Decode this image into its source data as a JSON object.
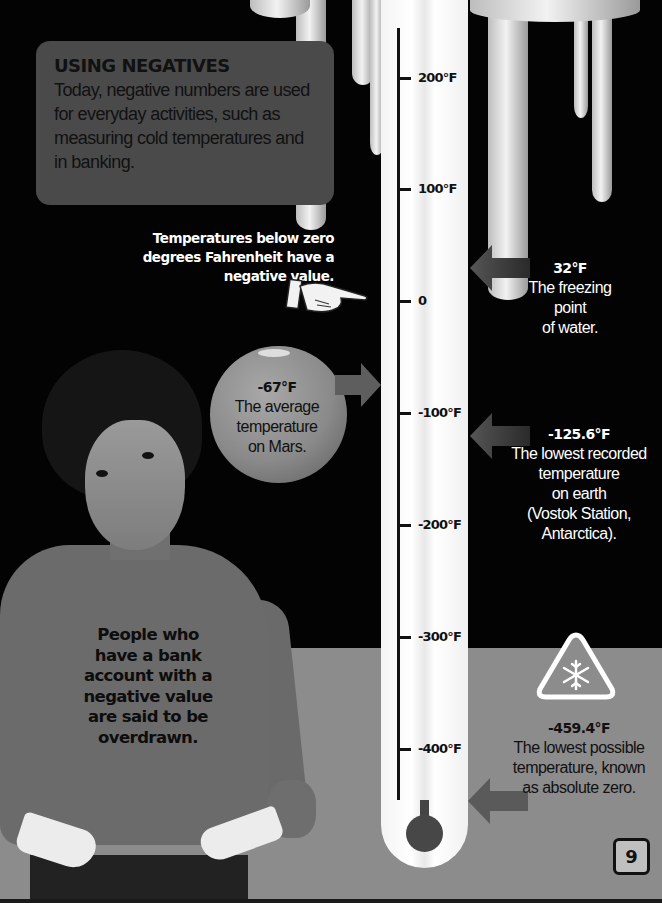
{
  "info_box": {
    "title": "USING NEGATIVES",
    "body": "Today, negative numbers are used for everyday activities, such as measuring cold temperatures and in banking."
  },
  "note": "Temperatures below zero degrees Fahrenheit have a negative value.",
  "thermometer": {
    "unit": "°F",
    "ticks": [
      {
        "label": "200°F",
        "value": 200
      },
      {
        "label": "100°F",
        "value": 100
      },
      {
        "label": "0",
        "value": 0
      },
      {
        "label": "-100°F",
        "value": -100
      },
      {
        "label": "-200°F",
        "value": -200
      },
      {
        "label": "-300°F",
        "value": -300
      },
      {
        "label": "-400°F",
        "value": -400
      }
    ]
  },
  "callouts": {
    "freezing": {
      "value": "32°F",
      "l1": "The freezing",
      "l2": "point",
      "l3": "of water."
    },
    "mars": {
      "value": "-67°F",
      "l1": "The average",
      "l2": "temperature",
      "l3": "on Mars."
    },
    "vostok": {
      "value": "-125.6°F",
      "l1": "The lowest recorded",
      "l2": "temperature",
      "l3": "on earth",
      "l4": "(Vostok Station,",
      "l5": "Antarctica)."
    },
    "absolute_zero": {
      "value": "-459.4°F",
      "l1": "The lowest possible",
      "l2": "temperature, known",
      "l3": "as absolute zero."
    }
  },
  "shirt_text": {
    "l1": "People who",
    "l2": "have a bank",
    "l3": "account with a",
    "l4": "negative value",
    "l5": "are said to be",
    "l6": "overdrawn."
  },
  "icons": {
    "hand": "pointing-hand-icon",
    "warning": "snowflake-warning-icon",
    "arrows": "arrow-icon"
  },
  "colors": {
    "background": "#030303",
    "lower_band": "#8c8c8c",
    "info_box": "#4a4a4a",
    "mercury": "#474747",
    "arrow": "#5e5e5e"
  },
  "page_number": "9"
}
